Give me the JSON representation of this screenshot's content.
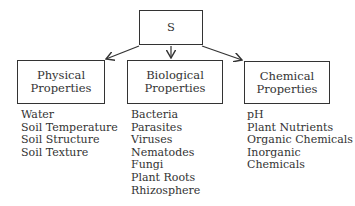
{
  "root": {
    "label": "S"
  },
  "categories": [
    {
      "title_line1": "Physical",
      "title_line2": "Properties",
      "items": [
        "Water",
        "Soil Temperature",
        "Soil Structure",
        "Soil Texture"
      ]
    },
    {
      "title_line1": "Biological",
      "title_line2": "Properties",
      "items": [
        "Bacteria",
        "Parasites",
        "Viruses",
        "Nematodes",
        "Fungi",
        "Plant Roots",
        "Rhizosphere"
      ]
    },
    {
      "title_line1": "Chemical",
      "title_line2": "Properties",
      "items": [
        "pH",
        "Plant Nutrients",
        "Organic Chemicals",
        "Inorganic Chemicals"
      ]
    }
  ]
}
